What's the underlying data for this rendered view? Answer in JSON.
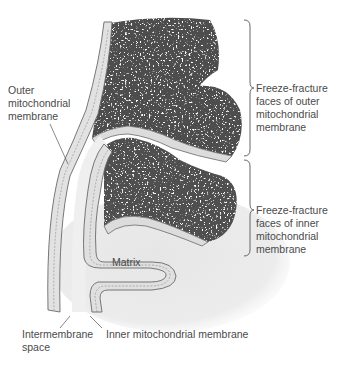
{
  "diagram": {
    "labels": {
      "outer_membrane": "Outer\nmitochondrial\nmembrane",
      "ff_outer": "Freeze-fracture\nfaces of outer\nmitochondrial\nmembrane",
      "ff_inner": "Freeze-fracture\nfaces of inner\nmitochondrial\nmembrane",
      "matrix": "Matrix",
      "intermembrane_space": "Intermembrane\nspace",
      "inner_membrane": "Inner mitochondrial membrane"
    },
    "colors": {
      "background": "#ffffff",
      "membrane_fill": "#e4e4e4",
      "membrane_stroke": "#6a6a6a",
      "fracture_face": "#4a4a4a",
      "matrix_fill": "#ececec",
      "label_text": "#4a4a4a",
      "leader_line": "#555555"
    }
  }
}
